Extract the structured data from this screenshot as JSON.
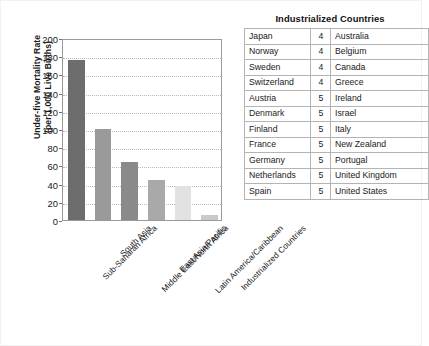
{
  "chart_data": {
    "type": "bar",
    "title": "",
    "xlabel": "",
    "ylabel": "Under-five Mortality Rate (per 1,000 Live Births)",
    "ylabel_line1": "Under-five Mortality Rate",
    "ylabel_line2": "(per 1,000 Live Births)",
    "ylim": [
      0,
      200
    ],
    "ytick_step": 20,
    "yticks": [
      0,
      20,
      40,
      60,
      80,
      100,
      120,
      140,
      160,
      180,
      200
    ],
    "grid": true,
    "legend": "none",
    "categories": [
      "Sub-Saharan Africa",
      "South Asia",
      "Middle East/North Africa",
      "East Asia/Pacific",
      "Latin America/Caribbean",
      "Industrialized Countries"
    ],
    "values": [
      176,
      100,
      64,
      44,
      37,
      6
    ],
    "bar_colors": [
      "#6d6d6d",
      "#9a9a9a",
      "#8a8a8a",
      "#a9a9a9",
      "#e2e2e2",
      "#c9c9c9"
    ]
  },
  "table": {
    "title": "Industrialized Countries",
    "columns": [
      "country_left",
      "rate",
      "country_right"
    ],
    "rows": [
      {
        "country_left": "Japan",
        "rate": "4",
        "country_right": "Australia"
      },
      {
        "country_left": "Norway",
        "rate": "4",
        "country_right": "Belgium"
      },
      {
        "country_left": "Sweden",
        "rate": "4",
        "country_right": "Canada"
      },
      {
        "country_left": "Switzerland",
        "rate": "4",
        "country_right": "Greece"
      },
      {
        "country_left": "Austria",
        "rate": "5",
        "country_right": "Ireland"
      },
      {
        "country_left": "Denmark",
        "rate": "5",
        "country_right": "Israel"
      },
      {
        "country_left": "Finland",
        "rate": "5",
        "country_right": "Italy"
      },
      {
        "country_left": "France",
        "rate": "5",
        "country_right": "New Zealand"
      },
      {
        "country_left": "Germany",
        "rate": "5",
        "country_right": "Portugal"
      },
      {
        "country_left": "Netherlands",
        "rate": "5",
        "country_right": "United Kingdom"
      },
      {
        "country_left": "Spain",
        "rate": "5",
        "country_right": "United States"
      }
    ]
  }
}
